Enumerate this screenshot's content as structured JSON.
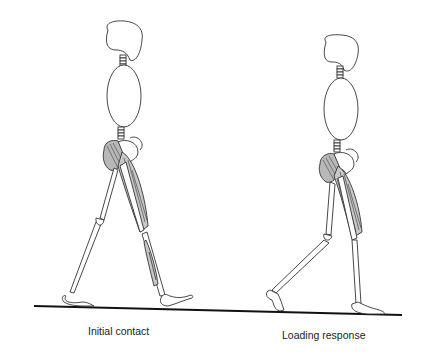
{
  "figure": {
    "type": "gait-phase-illustration",
    "ground_line_color": "#111111",
    "muscle_fill": "#c8c8c8",
    "stroke_color": "#333333",
    "panels": [
      {
        "id": "initial-contact",
        "caption": "Initial contact"
      },
      {
        "id": "loading-response",
        "caption": "Loading response"
      }
    ]
  }
}
